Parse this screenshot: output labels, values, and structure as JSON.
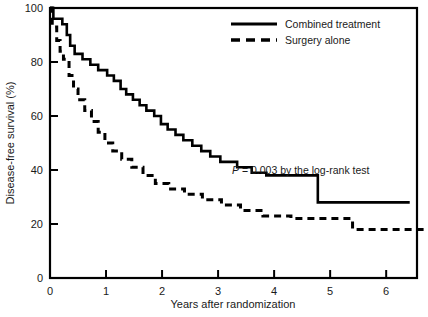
{
  "chart_data": {
    "type": "line",
    "title": "",
    "xlabel": "Years after randomization",
    "ylabel": "Disease-free survival (%)",
    "xlim": [
      0,
      6.55
    ],
    "ylim": [
      0,
      100
    ],
    "grid": false,
    "x_ticks": [
      0,
      1,
      2,
      3,
      4,
      5,
      6
    ],
    "x_tick_labels": [
      "0",
      "1",
      "2",
      "3",
      "4",
      "5",
      "6"
    ],
    "y_ticks": [
      0,
      20,
      40,
      60,
      80,
      100
    ],
    "y_tick_labels": [
      "0",
      "20",
      "40",
      "60",
      "80",
      "100"
    ],
    "legend_position": "top-center",
    "annotations": [
      {
        "name": "log-rank-pvalue",
        "italic_prefix": "P",
        "text": " = 0.003 by the log-rank test",
        "full_text": "P = 0.003 by the log-rank test",
        "x": 3.5,
        "y": 41
      }
    ],
    "series": [
      {
        "name": "Combined treatment",
        "style": "solid",
        "color": "#000000",
        "final_value": 28,
        "step": true,
        "points": [
          [
            0.0,
            100
          ],
          [
            0.06,
            100
          ],
          [
            0.06,
            96
          ],
          [
            0.22,
            96
          ],
          [
            0.22,
            94
          ],
          [
            0.3,
            94
          ],
          [
            0.3,
            90
          ],
          [
            0.36,
            90
          ],
          [
            0.36,
            86
          ],
          [
            0.44,
            86
          ],
          [
            0.44,
            83
          ],
          [
            0.58,
            83
          ],
          [
            0.58,
            81
          ],
          [
            0.72,
            81
          ],
          [
            0.72,
            79
          ],
          [
            0.86,
            79
          ],
          [
            0.86,
            77
          ],
          [
            1.02,
            77
          ],
          [
            1.02,
            75
          ],
          [
            1.14,
            75
          ],
          [
            1.14,
            73
          ],
          [
            1.26,
            73
          ],
          [
            1.26,
            70
          ],
          [
            1.36,
            70
          ],
          [
            1.36,
            68
          ],
          [
            1.48,
            68
          ],
          [
            1.48,
            66
          ],
          [
            1.6,
            66
          ],
          [
            1.6,
            64
          ],
          [
            1.72,
            64
          ],
          [
            1.72,
            62
          ],
          [
            1.86,
            62
          ],
          [
            1.86,
            60
          ],
          [
            1.98,
            60
          ],
          [
            1.98,
            57
          ],
          [
            2.1,
            57
          ],
          [
            2.1,
            55
          ],
          [
            2.24,
            55
          ],
          [
            2.24,
            53
          ],
          [
            2.38,
            53
          ],
          [
            2.38,
            51
          ],
          [
            2.54,
            51
          ],
          [
            2.54,
            49
          ],
          [
            2.7,
            49
          ],
          [
            2.7,
            47
          ],
          [
            2.86,
            47
          ],
          [
            2.86,
            45
          ],
          [
            3.04,
            45
          ],
          [
            3.04,
            43
          ],
          [
            3.34,
            43
          ],
          [
            3.34,
            41
          ],
          [
            3.6,
            41
          ],
          [
            3.6,
            39
          ],
          [
            3.86,
            39
          ],
          [
            3.86,
            38
          ],
          [
            4.78,
            38
          ],
          [
            4.78,
            28
          ],
          [
            6.42,
            28
          ]
        ]
      },
      {
        "name": "Surgery alone",
        "style": "dashed",
        "color": "#000000",
        "final_value": 18,
        "step": true,
        "points": [
          [
            0.0,
            100
          ],
          [
            0.04,
            100
          ],
          [
            0.04,
            93
          ],
          [
            0.12,
            93
          ],
          [
            0.12,
            88
          ],
          [
            0.18,
            88
          ],
          [
            0.18,
            84
          ],
          [
            0.24,
            84
          ],
          [
            0.24,
            81
          ],
          [
            0.34,
            81
          ],
          [
            0.34,
            75
          ],
          [
            0.42,
            75
          ],
          [
            0.42,
            70
          ],
          [
            0.5,
            70
          ],
          [
            0.5,
            66
          ],
          [
            0.62,
            66
          ],
          [
            0.62,
            62
          ],
          [
            0.74,
            62
          ],
          [
            0.74,
            58
          ],
          [
            0.86,
            58
          ],
          [
            0.86,
            54
          ],
          [
            0.98,
            54
          ],
          [
            0.98,
            50
          ],
          [
            1.12,
            50
          ],
          [
            1.12,
            47
          ],
          [
            1.28,
            47
          ],
          [
            1.28,
            44
          ],
          [
            1.46,
            44
          ],
          [
            1.46,
            41
          ],
          [
            1.66,
            41
          ],
          [
            1.66,
            38
          ],
          [
            1.88,
            38
          ],
          [
            1.88,
            35
          ],
          [
            2.12,
            35
          ],
          [
            2.12,
            33
          ],
          [
            2.4,
            33
          ],
          [
            2.4,
            31
          ],
          [
            2.72,
            31
          ],
          [
            2.72,
            29
          ],
          [
            3.06,
            29
          ],
          [
            3.06,
            27
          ],
          [
            3.4,
            27
          ],
          [
            3.4,
            25
          ],
          [
            3.8,
            25
          ],
          [
            3.8,
            23
          ],
          [
            4.3,
            23
          ],
          [
            4.3,
            22
          ],
          [
            5.4,
            22
          ],
          [
            5.4,
            18
          ],
          [
            6.68,
            18
          ]
        ]
      }
    ],
    "legend": [
      {
        "label": "Combined treatment",
        "style": "solid"
      },
      {
        "label": "Surgery alone",
        "style": "dashed"
      }
    ]
  }
}
